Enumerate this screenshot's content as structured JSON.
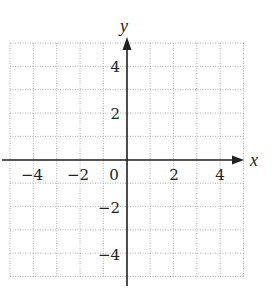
{
  "chart_data": {
    "type": "scatter",
    "title": "",
    "xlabel": "x",
    "ylabel": "y",
    "xlim": [
      -5,
      5
    ],
    "ylim": [
      -5,
      5
    ],
    "grid": true,
    "grid_step": 1,
    "grid_style": "dotted",
    "x_ticks": [
      -4,
      -2,
      0,
      2,
      4
    ],
    "y_ticks": [
      4,
      2,
      -2,
      -4
    ],
    "x_tick_labels": [
      "−4",
      "−2",
      "0",
      "2",
      "4"
    ],
    "y_tick_labels": [
      "4",
      "2",
      "−2",
      "−4"
    ],
    "series": [],
    "legend": null
  },
  "labels": {
    "x_axis": "x",
    "y_axis": "y",
    "origin": "0",
    "x_neg4": "−4",
    "x_neg2": "−2",
    "x_pos2": "2",
    "x_pos4": "4",
    "y_pos4": "4",
    "y_pos2": "2",
    "y_neg2": "−2",
    "y_neg4": "−4"
  },
  "colors": {
    "grid": "#9a9a9a",
    "axis": "#222222"
  }
}
